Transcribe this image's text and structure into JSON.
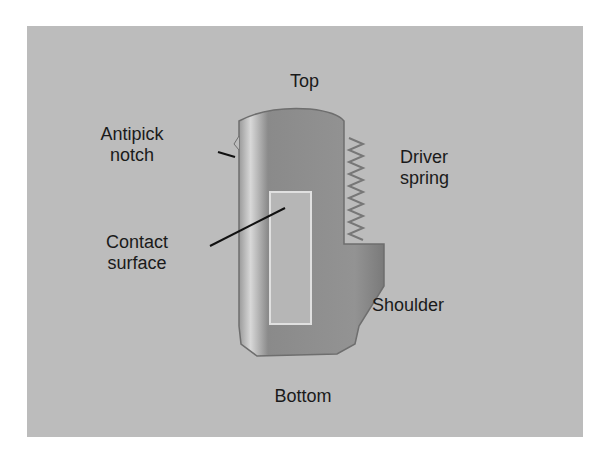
{
  "figure": {
    "colors": {
      "panel": "#bcbcbc",
      "part": "#8e8e8e",
      "text": "#1a1a1a"
    },
    "labels": {
      "top": "Top",
      "bottom": "Bottom",
      "antipick_line1": "Antipick",
      "antipick_line2": "notch",
      "contact_line1": "Contact",
      "contact_line2": "surface",
      "driver_line1": "Driver",
      "driver_line2": "spring",
      "shoulder": "Shoulder"
    }
  }
}
